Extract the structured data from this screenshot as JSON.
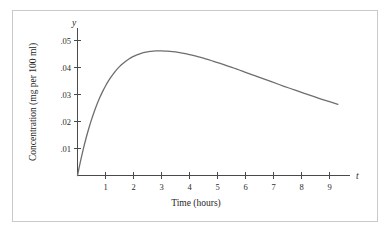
{
  "figure": {
    "frame_color": "#c9c9c9",
    "background_color": "#ffffff"
  },
  "chart_data": {
    "type": "line",
    "title": "",
    "subtitle": "",
    "xlabel": "Time (hours)",
    "ylabel": "Concentration (mg per 100 ml)",
    "x_axis_variable": "t",
    "y_axis_variable": "y",
    "grid": false,
    "legend": null,
    "legend_position": "none",
    "xlim": [
      0,
      9.7
    ],
    "ylim": [
      0,
      0.0605
    ],
    "x_ticks": [
      1,
      2,
      3,
      4,
      5,
      6,
      7,
      8,
      9
    ],
    "x_tick_labels": [
      "1",
      "2",
      "3",
      "4",
      "5",
      "6",
      "7",
      "8",
      "9"
    ],
    "y_ticks": [
      0.01,
      0.02,
      0.03,
      0.04,
      0.05
    ],
    "y_tick_labels": [
      ".01",
      ".02",
      ".03",
      ".04",
      ".05"
    ],
    "series": [
      {
        "name": "concentration",
        "color": "#6e6e6e",
        "x": [
          0.0,
          0.1,
          0.2,
          0.3,
          0.4,
          0.5,
          0.6,
          0.7,
          0.8,
          0.9,
          1.0,
          1.1,
          1.2,
          1.3,
          1.4,
          1.5,
          1.6,
          1.7,
          1.8,
          1.9,
          2.0,
          2.1,
          2.2,
          2.3,
          2.4,
          2.5,
          2.6,
          2.7,
          2.8,
          2.9,
          3.0,
          3.2,
          3.4,
          3.6,
          3.8,
          4.0,
          4.2,
          4.4,
          4.6,
          4.8,
          5.0,
          5.2,
          5.4,
          5.6,
          5.8,
          6.0,
          6.3,
          6.6,
          6.9,
          7.2,
          7.5,
          7.8,
          8.1,
          8.4,
          8.7,
          9.0,
          9.3
        ],
        "y": [
          0.0,
          0.00498,
          0.00951,
          0.01361,
          0.01733,
          0.02069,
          0.02373,
          0.02647,
          0.02894,
          0.03116,
          0.03315,
          0.03493,
          0.03652,
          0.03794,
          0.0392,
          0.04031,
          0.04129,
          0.04215,
          0.0429,
          0.04355,
          0.04411,
          0.04458,
          0.04498,
          0.04531,
          0.04558,
          0.04579,
          0.04595,
          0.04607,
          0.04614,
          0.04617,
          0.04617,
          0.04607,
          0.04587,
          0.04558,
          0.04521,
          0.04477,
          0.04427,
          0.04372,
          0.04313,
          0.0425,
          0.04184,
          0.04115,
          0.04044,
          0.03972,
          0.03898,
          0.03823,
          0.0371,
          0.03596,
          0.03483,
          0.0337,
          0.03259,
          0.03149,
          0.03041,
          0.02936,
          0.02833,
          0.02733,
          0.02636
        ],
        "peak_time": 2.0,
        "peak_value": 0.054
      }
    ]
  }
}
